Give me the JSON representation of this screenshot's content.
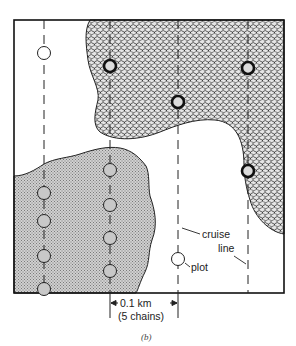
{
  "figure": {
    "caption": "(b)",
    "labels": {
      "cruise_line_1": "cruise",
      "cruise_line_2": "line",
      "plot": "plot",
      "scale_1": "0.1 km",
      "scale_2": "(5 chains)"
    },
    "cruise_lines": 4,
    "plots": [
      {
        "line": 1,
        "y": 53,
        "region": "white"
      },
      {
        "line": 1,
        "y": 193,
        "region": "light-stipple"
      },
      {
        "line": 1,
        "y": 221,
        "region": "light-stipple"
      },
      {
        "line": 1,
        "y": 256,
        "region": "light-stipple"
      },
      {
        "line": 1,
        "y": 288,
        "region": "light-stipple"
      },
      {
        "line": 2,
        "y": 66,
        "region": "dark-stipple"
      },
      {
        "line": 2,
        "y": 170,
        "region": "light-stipple"
      },
      {
        "line": 2,
        "y": 205,
        "region": "light-stipple"
      },
      {
        "line": 2,
        "y": 238,
        "region": "light-stipple"
      },
      {
        "line": 2,
        "y": 271,
        "region": "light-stipple"
      },
      {
        "line": 3,
        "y": 102,
        "region": "dark-stipple"
      },
      {
        "line": 3,
        "y": 259,
        "region": "white"
      },
      {
        "line": 4,
        "y": 68,
        "region": "dark-stipple"
      },
      {
        "line": 4,
        "y": 171,
        "region": "dark-stipple"
      }
    ],
    "colors": {
      "frame": "#111111",
      "dark_stipple": "#9a9a9a",
      "light_stipple": "#bdbdbd",
      "background": "#ffffff"
    }
  }
}
